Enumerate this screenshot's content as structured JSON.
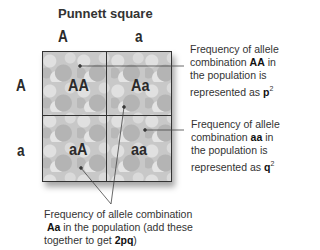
{
  "title": "Punnett square",
  "column_alleles": [
    "A",
    "a"
  ],
  "row_alleles": [
    "A",
    "a"
  ],
  "cells": [
    {
      "label": "AA"
    },
    {
      "label": "Aa"
    },
    {
      "label": "aA"
    },
    {
      "label": "aa"
    }
  ],
  "annotations": {
    "AA": {
      "line1": "Frequency of allele",
      "line2_pre": "combination ",
      "line2_bold": "AA",
      "line2_post": " in",
      "line3": "the population is",
      "line4_pre": "represented as ",
      "line4_bold": "p",
      "line4_sup": "2"
    },
    "aa": {
      "line1": "Frequency of allele",
      "line2_pre": "combination ",
      "line2_bold": "aa",
      "line2_post": " in",
      "line3": "the population is",
      "line4_pre": "represented as ",
      "line4_bold": "q",
      "line4_sup": "2"
    },
    "Aa": {
      "line1": "Frequency of allele combination",
      "line2_bold": "Aa",
      "line2_post": " in the population (add these",
      "line3_pre": "together to get ",
      "line3_bold": "2pq",
      "line3_post": ")"
    }
  },
  "colors": {
    "grid_border": "#333333",
    "cell_fill": "#c8c8c8",
    "text": "#2a2a2a"
  }
}
